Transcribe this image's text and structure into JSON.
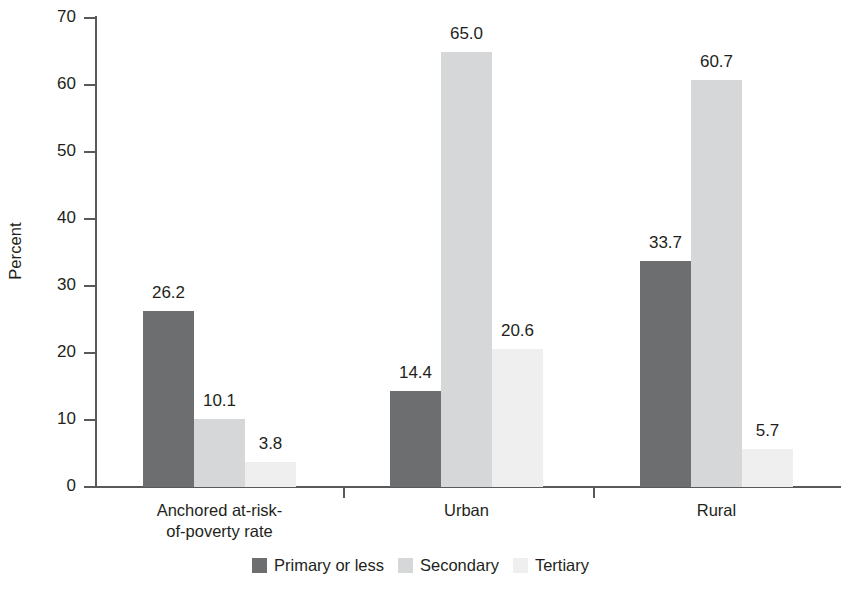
{
  "chart_data": {
    "type": "bar",
    "title": "",
    "subtitle": "",
    "xlabel": "",
    "ylabel": "Percent",
    "ylim": [
      0,
      70
    ],
    "ytick_step": 10,
    "ytick_labels": [
      "0",
      "10",
      "20",
      "30",
      "40",
      "50",
      "60",
      "70"
    ],
    "grid": false,
    "legend_position": "bottom-center",
    "grouped": true,
    "bar_gap_within_group": 0,
    "categories": [
      "Anchored at-risk-\nof-poverty rate",
      "Urban",
      "Rural"
    ],
    "category_labels": [
      [
        "Anchored at-risk-",
        "of-poverty rate"
      ],
      [
        "Urban"
      ],
      [
        "Rural"
      ]
    ],
    "series": [
      {
        "name": "Primary or less",
        "color": "#6d6e70",
        "values": [
          26.2,
          14.4,
          33.7
        ],
        "value_labels": [
          "26.2",
          "14.4",
          "33.7"
        ]
      },
      {
        "name": "Secondary",
        "color": "#d6d7d8",
        "values": [
          10.1,
          65.0,
          60.7
        ],
        "value_labels": [
          "10.1",
          "65.0",
          "60.7"
        ]
      },
      {
        "name": "Tertiary",
        "color": "#efefef",
        "values": [
          3.8,
          20.6,
          5.7
        ],
        "value_labels": [
          "3.8",
          "20.6",
          "5.7"
        ]
      }
    ]
  },
  "axis": {
    "y_title": "Percent",
    "line_color": "#58595b"
  },
  "legend": {
    "items": [
      {
        "label": "Primary or less",
        "color": "#6d6e70"
      },
      {
        "label": "Secondary",
        "color": "#d6d7d8"
      },
      {
        "label": "Tertiary",
        "color": "#efefef"
      }
    ]
  }
}
